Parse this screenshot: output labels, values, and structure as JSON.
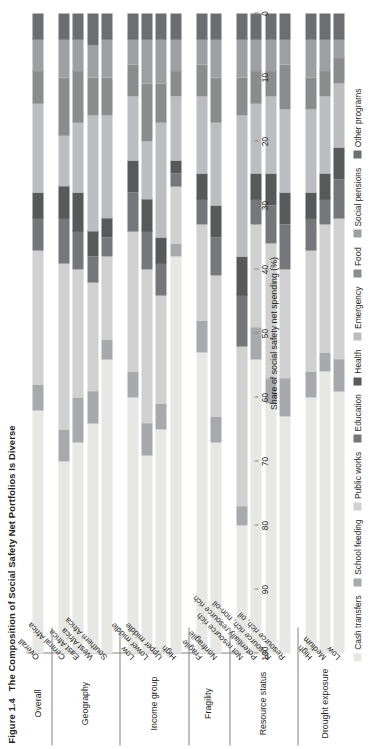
{
  "title": {
    "figure_number": "Figure 1.4",
    "text": "The Composition of Social Safety Net Portfolios Is Diverse"
  },
  "axis": {
    "value_title": "Share of social safety net spending (%)",
    "ticks": [
      "100",
      "90",
      "80",
      "70",
      "60",
      "50",
      "40",
      "30",
      "20",
      "10",
      "0"
    ],
    "min": 0,
    "max": 100,
    "reversed": true
  },
  "legend": {
    "items": [
      {
        "label": "Cash transfers",
        "color": "#e7e7e4"
      },
      {
        "label": "School feeding",
        "color": "#a8a9ad"
      },
      {
        "label": "Public works",
        "color": "#cfd0cf"
      },
      {
        "label": "Education",
        "color": "#76777b"
      },
      {
        "label": "Health",
        "color": "#58595b"
      },
      {
        "label": "Emergency",
        "color": "#bcbdc0"
      },
      {
        "label": "Food",
        "color": "#8a8c8e"
      },
      {
        "label": "Social pensions",
        "color": "#9d9fa2"
      },
      {
        "label": "Other programs",
        "color": "#6d6e71"
      }
    ]
  },
  "chart_data": {
    "type": "bar",
    "orientation": "horizontal-stacked-100",
    "title": "The Composition of Social Safety Net Portfolios Is Diverse",
    "xlabel": "Share of social safety net spending (%)",
    "ylabel": "",
    "xlim": [
      0,
      100
    ],
    "grid": false,
    "legend_position": "bottom",
    "series": [
      {
        "name": "Cash transfers",
        "color": "#e7e7e4",
        "values": [
          38,
          30,
          33,
          36,
          46,
          40,
          31,
          35,
          62,
          47,
          33,
          20,
          46,
          39,
          37,
          40,
          44,
          41
        ]
      },
      {
        "name": "School feeding",
        "color": "#a8a9ad",
        "values": [
          4,
          5,
          7,
          5,
          3,
          4,
          5,
          4,
          2,
          5,
          4,
          3,
          5,
          4,
          6,
          4,
          3,
          5
        ]
      },
      {
        "name": "Public works",
        "color": "#cfd0cf",
        "values": [
          21,
          26,
          20,
          17,
          13,
          22,
          24,
          17,
          9,
          15,
          22,
          25,
          16,
          21,
          17,
          19,
          20,
          22
        ]
      },
      {
        "name": "Education",
        "color": "#76777b",
        "values": [
          5,
          7,
          6,
          4,
          3,
          6,
          6,
          5,
          2,
          4,
          6,
          8,
          4,
          6,
          7,
          5,
          4,
          6
        ]
      },
      {
        "name": "Health",
        "color": "#58595b",
        "values": [
          4,
          5,
          6,
          4,
          3,
          5,
          5,
          4,
          2,
          4,
          5,
          6,
          4,
          5,
          5,
          4,
          4,
          5
        ]
      },
      {
        "name": "Emergency",
        "color": "#bcbdc0",
        "values": [
          14,
          8,
          11,
          18,
          16,
          10,
          9,
          18,
          10,
          12,
          13,
          22,
          11,
          12,
          13,
          13,
          12,
          10
        ]
      },
      {
        "name": "Food",
        "color": "#8a8c8e",
        "values": [
          5,
          9,
          8,
          6,
          6,
          5,
          9,
          6,
          4,
          5,
          7,
          6,
          5,
          4,
          7,
          5,
          4,
          4
        ]
      },
      {
        "name": "Social pensions",
        "color": "#9d9fa2",
        "values": [
          5,
          6,
          5,
          5,
          6,
          4,
          7,
          7,
          5,
          4,
          6,
          6,
          5,
          5,
          4,
          6,
          5,
          3
        ]
      },
      {
        "name": "Other programs",
        "color": "#6d6e71",
        "values": [
          4,
          4,
          4,
          5,
          4,
          4,
          4,
          4,
          4,
          4,
          4,
          4,
          4,
          4,
          4,
          4,
          4,
          4
        ]
      }
    ],
    "groups": [
      {
        "label": "Overall",
        "categories": [
          "Overall"
        ]
      },
      {
        "label": "Geography",
        "categories": [
          "Central Africa",
          "East Africa",
          "West Africa",
          "Southern Africa"
        ]
      },
      {
        "label": "Income group",
        "categories": [
          "Low",
          "Lower middle",
          "Upper middle",
          "High"
        ]
      },
      {
        "label": "Fragility",
        "categories": [
          "Fragile",
          "Nonfragile"
        ]
      },
      {
        "label": "Resource status",
        "categories": [
          "Not resource rich",
          "Potentially resource rich",
          "Resource rich, non-oil",
          "Resource rich, oil"
        ]
      },
      {
        "label": "Drought exposure",
        "categories": [
          "High",
          "Medium",
          "Low"
        ]
      }
    ],
    "categories": [
      "Overall",
      "Central Africa",
      "East Africa",
      "West Africa",
      "Southern Africa",
      "Low",
      "Lower middle",
      "Upper middle",
      "High",
      "Fragile",
      "Nonfragile",
      "Not resource rich",
      "Potentially resource rich",
      "Resource rich, non-oil",
      "Resource rich, oil",
      "High",
      "Medium",
      "Low"
    ]
  }
}
